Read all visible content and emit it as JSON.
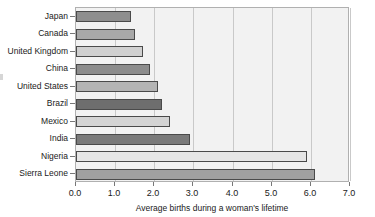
{
  "chart_data": {
    "type": "bar",
    "orientation": "horizontal",
    "title": "",
    "xlabel": "Average births during a woman's lifetime",
    "ylabel": "",
    "categories": [
      "Japan",
      "Canada",
      "United Kingdom",
      "China",
      "United States",
      "Brazil",
      "Mexico",
      "India",
      "Nigeria",
      "Sierra Leone"
    ],
    "values": [
      1.4,
      1.5,
      1.7,
      1.9,
      2.1,
      2.2,
      2.4,
      2.9,
      5.9,
      6.1
    ],
    "xlim": [
      0.0,
      7.0
    ],
    "xticks": [
      "0.0",
      "1.0",
      "2.0",
      "3.0",
      "4.0",
      "5.0",
      "6.0",
      "7.0"
    ],
    "xtick_values": [
      0.0,
      1.0,
      2.0,
      3.0,
      4.0,
      5.0,
      6.0,
      7.0
    ],
    "grid": true,
    "legend": null,
    "bar_colors": [
      "#8e8e8e",
      "#a8a8a8",
      "#d0d0d0",
      "#8c8c8c",
      "#b4b4b4",
      "#6e6e6e",
      "#d4d4d4",
      "#7a7a7a",
      "#e6e6e6",
      "#a0a0a0"
    ],
    "bar_edge_color": "#4a4a4a",
    "plot_background": "#f2f2f2",
    "grid_color": "#c9c9c9",
    "axis_color": "#777777"
  }
}
